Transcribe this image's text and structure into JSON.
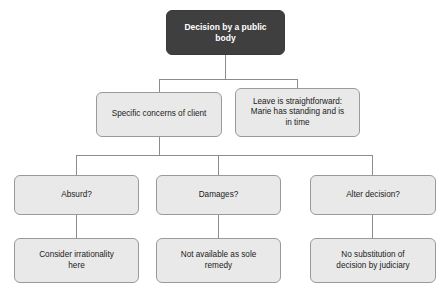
{
  "diagram": {
    "colors": {
      "root_fill": "#3f3f3f",
      "root_text": "#ffffff",
      "node_fill": "#e9e9e9",
      "node_border": "#9a9a9a",
      "node_text": "#1a1a1a",
      "connector": "#8c8c8c",
      "background": "#ffffff"
    },
    "nodes": {
      "root": "Decision by a public\nbody",
      "specific_concerns": "Specific concerns of client",
      "leave_straightforward": "Leave is straightforward:\nMarie has standing and is\nin time",
      "absurd": "Absurd?",
      "damages": "Damages?",
      "alter_decision": "Alter decision?",
      "consider_irrationality": "Consider irrationality\nhere",
      "not_available": "Not available as sole\nremedy",
      "no_substitution": "No substitution of\ndecision by judiciary"
    }
  }
}
